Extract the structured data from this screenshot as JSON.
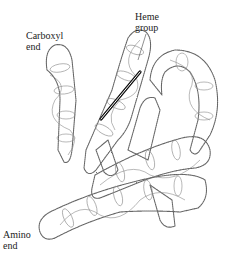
{
  "diagram": {
    "labels": {
      "carboxyl_end": "Carboxyl\nend",
      "heme_group": "Heme\ngroup",
      "amino_end": "Amino\nend"
    },
    "colors": {
      "background": "#ffffff",
      "outline": "#555555",
      "stipple": "#777777",
      "helix_lines": "#888888",
      "heme": "#111111",
      "text": "#222222"
    }
  }
}
